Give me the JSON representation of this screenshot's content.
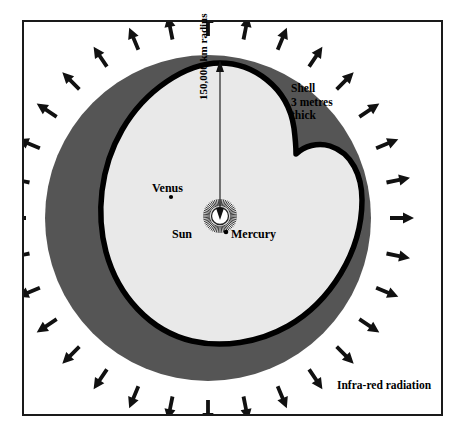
{
  "diagram": {
    "frame": {
      "border_color": "#1a1a1a",
      "background": "#ffffff"
    },
    "colors": {
      "shell_outer": "#555555",
      "shell_outline": "#000000",
      "interior": "#e9e9e9",
      "sun": "#ffffff",
      "arrow": "#111111",
      "border": "#1a1a1a",
      "text": "#000000"
    },
    "labels": {
      "shell": "Shell\n3 metres\nthick",
      "infrared": "Infra-red radiation",
      "radius": "150,000 km radius",
      "sun": "Sun",
      "venus": "Venus",
      "mercury": "Mercury"
    },
    "bodies": [
      {
        "name": "Sun",
        "x": 220,
        "y": 216,
        "kind": "star",
        "radius_px": 9
      },
      {
        "name": "Venus",
        "x": 171,
        "y": 197,
        "kind": "planet",
        "radius_px": 2
      },
      {
        "name": "Mercury",
        "x": 226,
        "y": 232,
        "kind": "planet",
        "radius_px": 2.2
      }
    ],
    "radius_arrow": {
      "from_x": 220,
      "from_y": 216,
      "to_x": 220,
      "to_y": 63
    },
    "arrows": {
      "count": 32,
      "label": "Infra-red radiation arrows",
      "inner_radius": 182,
      "outer_radius": 206,
      "center_x": 208,
      "center_y": 218
    },
    "sun_rays": {
      "count": 56,
      "inner": 10,
      "outer": 17
    }
  },
  "chart_data": {
    "type": "diagram",
    "annotations": [
      "Shell 3 metres thick",
      "150,000 km radius",
      "Infra-red radiation",
      "Sun",
      "Venus",
      "Mercury"
    ]
  }
}
